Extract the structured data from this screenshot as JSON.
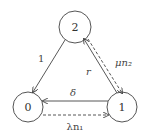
{
  "diagram": {
    "type": "state-transition",
    "nodes": [
      {
        "id": "2",
        "label": "2",
        "cx": 75,
        "cy": 27,
        "r": 16
      },
      {
        "id": "0",
        "label": "0",
        "cx": 28,
        "cy": 107,
        "r": 15
      },
      {
        "id": "1",
        "label": "1",
        "cx": 122,
        "cy": 107,
        "r": 15
      }
    ],
    "edges": [
      {
        "from": "2",
        "to": "0",
        "style": "solid",
        "label": "1"
      },
      {
        "from": "1",
        "to": "2",
        "style": "solid",
        "label": "r"
      },
      {
        "from": "2",
        "to": "1",
        "style": "dashed",
        "label": "μn₂"
      },
      {
        "from": "1",
        "to": "0",
        "style": "solid",
        "label": "δ"
      },
      {
        "from": "0",
        "to": "1",
        "style": "dashed",
        "label": "λn₁"
      }
    ],
    "colors": {
      "stroke": "#444444",
      "background": "#ffffff"
    }
  }
}
